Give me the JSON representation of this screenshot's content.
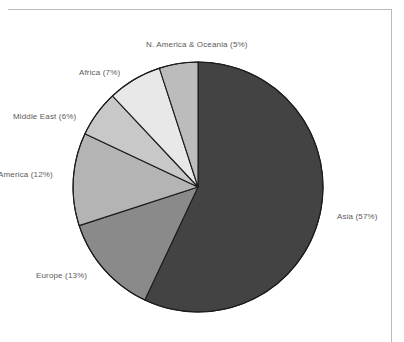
{
  "page": {
    "background_color": "#ffffff",
    "frame_color": "#b9b9b9"
  },
  "chart_data": {
    "type": "pie",
    "title": "",
    "subtitle": "",
    "xlabel": "",
    "ylabel": "",
    "legend_position": "none",
    "labels_position": "outside",
    "grid": false,
    "start_angle_deg": 0,
    "direction": "clockwise",
    "center": {
      "x": 198,
      "y": 187
    },
    "radius": 125,
    "categories": [
      "Asia",
      "Europe",
      "America",
      "Middle East",
      "Africa",
      "N. America & Oceania"
    ],
    "values": [
      57,
      13,
      12,
      6,
      7,
      5
    ],
    "value_unit": "%",
    "total": 100,
    "slices": [
      {
        "name": "Asia",
        "value": 57,
        "label": "Asia (57%)",
        "color": "#434343",
        "start_deg": 0,
        "end_deg": 205.2
      },
      {
        "name": "Europe",
        "value": 13,
        "label": "Europe (13%)",
        "color": "#8a8a8a",
        "start_deg": 205.2,
        "end_deg": 252.0
      },
      {
        "name": "America",
        "value": 12,
        "label": "America (12%)",
        "color": "#b4b4b4",
        "start_deg": 252.0,
        "end_deg": 295.2
      },
      {
        "name": "Middle East",
        "value": 6,
        "label": "Middle East (6%)",
        "color": "#c8c8c8",
        "start_deg": 295.2,
        "end_deg": 316.8
      },
      {
        "name": "Africa",
        "value": 7,
        "label": "Africa (7%)",
        "color": "#e8e8e8",
        "start_deg": 316.8,
        "end_deg": 342.0
      },
      {
        "name": "N. America & Oceania",
        "value": 5,
        "label": "N. America & Oceania (5%)",
        "color": "#bcbcbc",
        "start_deg": 342.0,
        "end_deg": 360.0
      }
    ],
    "slice_outline_color": "#1c1c1c",
    "label_color": "#5a5a5a"
  }
}
